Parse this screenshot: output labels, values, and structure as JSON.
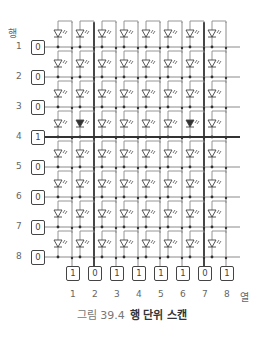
{
  "labels": {
    "row_axis": "행",
    "col_axis": "열"
  },
  "rows": [
    {
      "label": "1",
      "value": "0"
    },
    {
      "label": "2",
      "value": "0"
    },
    {
      "label": "3",
      "value": "0"
    },
    {
      "label": "4",
      "value": "1"
    },
    {
      "label": "5",
      "value": "0"
    },
    {
      "label": "6",
      "value": "0"
    },
    {
      "label": "7",
      "value": "0"
    },
    {
      "label": "8",
      "value": "0"
    }
  ],
  "columns": [
    {
      "label": "1",
      "value": "1"
    },
    {
      "label": "2",
      "value": "0"
    },
    {
      "label": "3",
      "value": "1"
    },
    {
      "label": "4",
      "value": "1"
    },
    {
      "label": "5",
      "value": "1"
    },
    {
      "label": "6",
      "value": "1"
    },
    {
      "label": "7",
      "value": "0"
    },
    {
      "label": "8",
      "value": "1"
    }
  ],
  "lit_leds": [
    {
      "row": 4,
      "col": 2
    },
    {
      "row": 4,
      "col": 7
    }
  ],
  "caption": {
    "number": "그림 39.4",
    "title": "행 단위 스캔"
  },
  "colors": {
    "wire": "#8a8a8a",
    "active_wire": "#333333",
    "led_off": "#ffffff",
    "led_on": "#333333"
  }
}
